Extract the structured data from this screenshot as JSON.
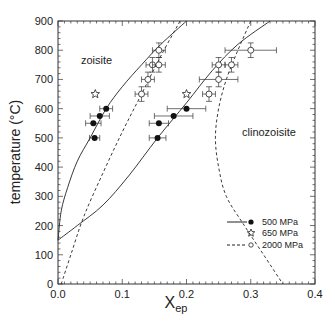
{
  "chart_data": {
    "type": "scatter",
    "title": "",
    "xlabel": "X",
    "xlabel_subscript": "ep",
    "ylabel": "temperature (°C)",
    "xlim": [
      0.0,
      0.4
    ],
    "ylim": [
      0,
      900
    ],
    "x_ticks": [
      "0.0",
      "0.1",
      "0.2",
      "0.3",
      "0.4"
    ],
    "y_ticks": [
      "0",
      "100",
      "200",
      "300",
      "400",
      "500",
      "600",
      "700",
      "800",
      "900"
    ],
    "grid": false,
    "legend_position": "lower right",
    "annotations": [
      {
        "text": "zoisite",
        "x": 0.05,
        "y": 800
      },
      {
        "text": "clinozoisite",
        "x": 0.28,
        "y": 515
      }
    ],
    "legend": [
      {
        "label": "500 MPa",
        "line": "solid",
        "marker": "filled-circle"
      },
      {
        "label": "650 MPa",
        "line": "none",
        "marker": "open-star"
      },
      {
        "label": "2000 MPa",
        "line": "dashed",
        "marker": "open-circle"
      }
    ],
    "series": [
      {
        "name": "500 MPa",
        "marker": "filled-circle",
        "points": [
          {
            "x": 0.075,
            "y": 600,
            "xerr": 0.01
          },
          {
            "x": 0.065,
            "y": 575,
            "xerr": 0.015
          },
          {
            "x": 0.055,
            "y": 550,
            "xerr": 0.012
          },
          {
            "x": 0.057,
            "y": 500,
            "xerr": 0.008
          },
          {
            "x": 0.2,
            "y": 600,
            "xerr": 0.03
          },
          {
            "x": 0.18,
            "y": 575,
            "xerr": 0.03
          },
          {
            "x": 0.157,
            "y": 550,
            "xerr": 0.015
          },
          {
            "x": 0.155,
            "y": 500,
            "xerr": 0.013
          }
        ]
      },
      {
        "name": "650 MPa",
        "marker": "open-star",
        "points": [
          {
            "x": 0.058,
            "y": 650
          },
          {
            "x": 0.2,
            "y": 650
          }
        ]
      },
      {
        "name": "2000 MPa",
        "marker": "open-circle",
        "points": [
          {
            "x": 0.157,
            "y": 800,
            "xerr": 0.01,
            "yerr": 25
          },
          {
            "x": 0.147,
            "y": 750,
            "xerr": 0.01,
            "yerr": 25
          },
          {
            "x": 0.157,
            "y": 750,
            "xerr": 0.01,
            "yerr": 25
          },
          {
            "x": 0.14,
            "y": 700,
            "xerr": 0.01,
            "yerr": 25
          },
          {
            "x": 0.13,
            "y": 650,
            "xerr": 0.01,
            "yerr": 25
          },
          {
            "x": 0.3,
            "y": 800,
            "xerr": 0.04,
            "yerr": 25
          },
          {
            "x": 0.25,
            "y": 750,
            "xerr": 0.01,
            "yerr": 25
          },
          {
            "x": 0.27,
            "y": 750,
            "xerr": 0.01,
            "yerr": 25
          },
          {
            "x": 0.25,
            "y": 700,
            "xerr": 0.03,
            "yerr": 25
          },
          {
            "x": 0.235,
            "y": 650,
            "xerr": 0.01,
            "yerr": 25
          }
        ]
      }
    ],
    "curves": [
      {
        "name": "500 MPa zoisite limb",
        "style": "solid",
        "points": [
          [
            0.0,
            150
          ],
          [
            0.005,
            250
          ],
          [
            0.015,
            330
          ],
          [
            0.03,
            420
          ],
          [
            0.05,
            500
          ],
          [
            0.075,
            600
          ],
          [
            0.1,
            675
          ],
          [
            0.13,
            750
          ],
          [
            0.16,
            820
          ],
          [
            0.2,
            900
          ]
        ]
      },
      {
        "name": "500 MPa clinozoisite limb",
        "style": "solid",
        "points": [
          [
            0.0,
            150
          ],
          [
            0.03,
            200
          ],
          [
            0.07,
            270
          ],
          [
            0.11,
            370
          ],
          [
            0.155,
            500
          ],
          [
            0.2,
            620
          ],
          [
            0.24,
            730
          ],
          [
            0.28,
            820
          ],
          [
            0.33,
            900
          ]
        ]
      },
      {
        "name": "2000 MPa zoisite limb",
        "style": "dashed",
        "points": [
          [
            0.005,
            0
          ],
          [
            0.02,
            100
          ],
          [
            0.04,
            230
          ],
          [
            0.07,
            380
          ],
          [
            0.1,
            520
          ],
          [
            0.13,
            650
          ],
          [
            0.16,
            780
          ],
          [
            0.19,
            900
          ]
        ]
      },
      {
        "name": "2000 MPa clinozoisite limb",
        "style": "dashed",
        "points": [
          [
            0.3,
            900
          ],
          [
            0.28,
            800
          ],
          [
            0.262,
            700
          ],
          [
            0.25,
            600
          ],
          [
            0.245,
            500
          ],
          [
            0.25,
            400
          ],
          [
            0.262,
            300
          ],
          [
            0.29,
            200
          ],
          [
            0.32,
            100
          ],
          [
            0.35,
            0
          ]
        ]
      }
    ]
  }
}
